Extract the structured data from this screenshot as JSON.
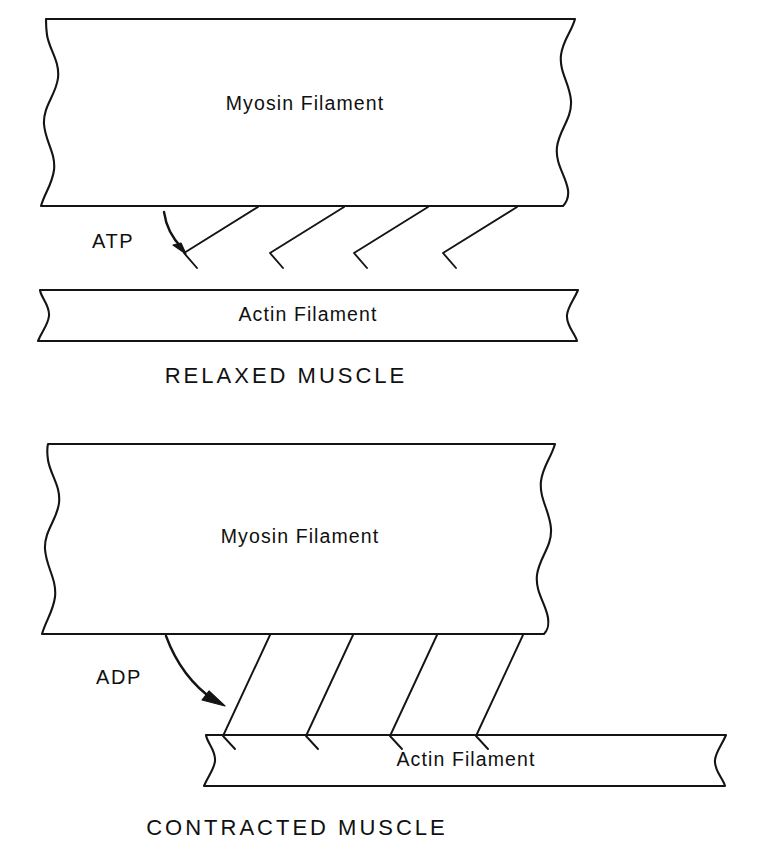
{
  "figure": {
    "background_color": "#ffffff",
    "line_color": "#141414",
    "text_color": "#101010"
  },
  "panels": [
    {
      "id": "relaxed",
      "caption": "RELAXED MUSCLE",
      "myosin_label": "Myosin Filament",
      "actin_label": "Actin Filament",
      "molecule_label": "ATP",
      "crossbridge_count": 4,
      "crossbridge_state": "detached-angled"
    },
    {
      "id": "contracted",
      "caption": "CONTRACTED MUSCLE",
      "myosin_label": "Myosin Filament",
      "actin_label": "Actin Filament",
      "molecule_label": "ADP",
      "crossbridge_count": 4,
      "crossbridge_state": "attached-steep"
    }
  ]
}
